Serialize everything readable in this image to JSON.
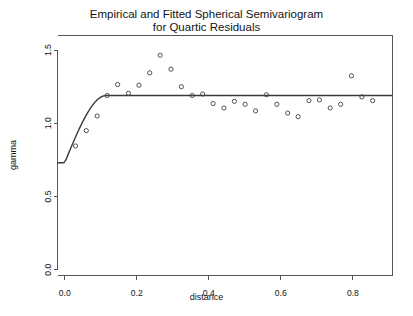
{
  "chart_data": {
    "type": "scatter",
    "title": "Empirical and Fitted Spherical Semivariogram for Quartic Residuals",
    "title_line1": "Empirical and Fitted Spherical Semivariogram",
    "title_line2": "for Quartic Residuals",
    "xlabel": "distance",
    "ylabel": "gamma",
    "xlim": [
      -0.02,
      0.91
    ],
    "ylim": [
      -0.04,
      1.6
    ],
    "xticks": [
      0.0,
      0.2,
      0.4,
      0.6,
      0.8
    ],
    "xtick_labels": [
      "0.0",
      "0.2",
      "0.4",
      "0.6",
      "0.8"
    ],
    "yticks": [
      0.0,
      0.5,
      1.0,
      1.5
    ],
    "ytick_labels": [
      "0.0",
      "0.5",
      "1.0",
      "1.5"
    ],
    "grid": false,
    "legend": "none",
    "series": [
      {
        "name": "Empirical semivariogram",
        "marker": "open-circle",
        "type": "scatter",
        "x": [
          0.03,
          0.06,
          0.09,
          0.118,
          0.147,
          0.177,
          0.206,
          0.236,
          0.265,
          0.295,
          0.324,
          0.354,
          0.383,
          0.412,
          0.442,
          0.471,
          0.501,
          0.53,
          0.56,
          0.589,
          0.619,
          0.648,
          0.678,
          0.707,
          0.737,
          0.766,
          0.796,
          0.825,
          0.855
        ],
        "y": [
          0.845,
          0.95,
          1.05,
          1.19,
          1.265,
          1.205,
          1.26,
          1.345,
          1.465,
          1.37,
          1.25,
          1.19,
          1.2,
          1.135,
          1.105,
          1.15,
          1.13,
          1.085,
          1.195,
          1.13,
          1.07,
          1.045,
          1.155,
          1.16,
          1.105,
          1.13,
          1.325,
          1.18,
          1.155
        ]
      },
      {
        "name": "Fitted spherical model",
        "marker": "none",
        "type": "line",
        "nugget": 0.73,
        "sill": 1.19,
        "range": 0.115
      }
    ]
  },
  "figure": {
    "background_color": "#ffffff",
    "axis_color": "#555555",
    "point_color": "#3f3f3f",
    "curve_color": "#3a3a3a"
  }
}
